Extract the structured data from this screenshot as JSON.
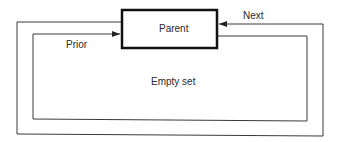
{
  "diagram": {
    "type": "linked-list-circular",
    "nodes": [
      {
        "id": "parent",
        "label": "Parent"
      }
    ],
    "region_label": "Empty set",
    "edges": [
      {
        "id": "next",
        "label": "Next",
        "direction": "into parent from right"
      },
      {
        "id": "prior",
        "label": "Prior",
        "direction": "into parent from left"
      }
    ]
  },
  "colors": {
    "line": "#3a3a3a",
    "box_border": "#111111",
    "text": "#2a2a2a",
    "background": "#ffffff"
  }
}
